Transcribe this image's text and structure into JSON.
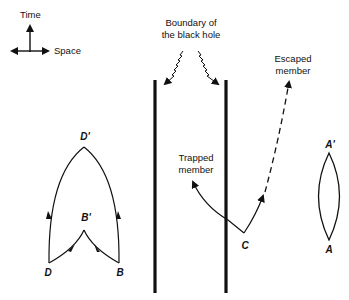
{
  "axes": {
    "time_label": "Time",
    "space_label": "Space"
  },
  "black_hole": {
    "boundary_label_line1": "Boundary of",
    "boundary_label_line2": "the black hole"
  },
  "members": {
    "trapped_line1": "Trapped",
    "trapped_line2": "member",
    "escaped_line1": "Escaped",
    "escaped_line2": "member",
    "origin_label": "C"
  },
  "loop_diagram": {
    "top_label": "D'",
    "inner_label": "B'",
    "left_label": "D",
    "right_label": "B"
  },
  "lens_diagram": {
    "top_label": "A'",
    "bottom_label": "A"
  },
  "colors": {
    "ink": "#111111",
    "background": "#ffffff"
  }
}
